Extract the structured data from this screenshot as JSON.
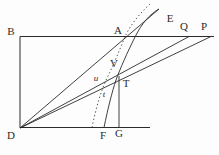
{
  "figure": {
    "background": "#fdfdfd",
    "line_color": "#2b2b2b",
    "labels": {
      "B": "B",
      "A": "A",
      "E": "E",
      "Q": "Q",
      "P": "P",
      "V": "V",
      "T": "T",
      "u": "u",
      "t": "t",
      "D": "D",
      "F": "F",
      "G": "G"
    }
  }
}
